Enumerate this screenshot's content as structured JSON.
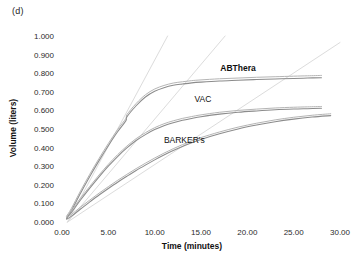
{
  "panel": {
    "label": "(d)"
  },
  "chart_data": {
    "type": "line",
    "title": "",
    "subtitle": "",
    "xlabel": "Time (minutes)",
    "ylabel": "Volume (liters)",
    "xlim": [
      0,
      30
    ],
    "ylim": [
      0,
      1.0
    ],
    "xticks": [
      "0.00",
      "5.00",
      "10.00",
      "15.00",
      "20.00",
      "25.00",
      "30.00"
    ],
    "xtick_values": [
      0,
      5,
      10,
      15,
      20,
      25,
      30
    ],
    "yticks": [
      "0.000",
      "0.100",
      "0.200",
      "0.300",
      "0.400",
      "0.500",
      "0.600",
      "0.700",
      "0.800",
      "0.900",
      "1.000"
    ],
    "ytick_values": [
      0.0,
      0.1,
      0.2,
      0.3,
      0.4,
      0.5,
      0.6,
      0.7,
      0.8,
      0.9,
      1.0
    ],
    "grid": false,
    "legend_position": "inline-annotation",
    "series": [
      {
        "name": "ABThera",
        "label_bold": true,
        "color": "#8c8c8c",
        "x": [
          0.5,
          1.0,
          2.0,
          3.0,
          4.0,
          5.0,
          6.0,
          6.9,
          7.0,
          8.0,
          9.0,
          10.0,
          11.0,
          12.0,
          13.0,
          14.0,
          15.0,
          17.0,
          19.0,
          21.0,
          23.0,
          25.0,
          26.5,
          28.0
        ],
        "y": [
          0.02,
          0.06,
          0.155,
          0.245,
          0.33,
          0.41,
          0.485,
          0.545,
          0.565,
          0.625,
          0.672,
          0.703,
          0.722,
          0.735,
          0.742,
          0.748,
          0.752,
          0.758,
          0.762,
          0.766,
          0.769,
          0.772,
          0.774,
          0.776
        ],
        "band_offset": 0.012
      },
      {
        "name": "VAC",
        "label_bold": false,
        "color": "#9a9a9a",
        "x": [
          0.5,
          1.0,
          2.0,
          3.0,
          4.0,
          5.0,
          6.0,
          7.0,
          8.0,
          9.0,
          10.0,
          11.0,
          12.0,
          13.0,
          14.0,
          15.0,
          17.0,
          19.0,
          21.0,
          23.0,
          25.0,
          26.5,
          28.0
        ],
        "y": [
          0.02,
          0.05,
          0.118,
          0.182,
          0.243,
          0.3,
          0.352,
          0.398,
          0.438,
          0.47,
          0.497,
          0.518,
          0.534,
          0.547,
          0.557,
          0.566,
          0.58,
          0.59,
          0.597,
          0.603,
          0.607,
          0.609,
          0.611
        ],
        "band_offset": 0.01
      },
      {
        "name": "BARKER's",
        "label_bold": false,
        "color": "#9a9a9a",
        "x": [
          0.5,
          1.0,
          2.0,
          3.0,
          4.0,
          5.0,
          6.0,
          7.0,
          8.0,
          9.0,
          10.0,
          11.0,
          12.0,
          13.0,
          14.0,
          15.0,
          17.0,
          19.0,
          21.0,
          23.0,
          25.0,
          27.0,
          29.0
        ],
        "y": [
          0.015,
          0.03,
          0.07,
          0.108,
          0.145,
          0.18,
          0.214,
          0.246,
          0.277,
          0.306,
          0.334,
          0.36,
          0.384,
          0.406,
          0.426,
          0.444,
          0.474,
          0.5,
          0.521,
          0.539,
          0.553,
          0.564,
          0.572
        ],
        "band_offset": 0.01
      }
    ],
    "tangent_lines": [
      {
        "name": "ABThera-initial-slope",
        "x0": 0.6,
        "y0": 0.0,
        "x1": 11.4,
        "y1": 1.0,
        "color": "#dcdcdc"
      },
      {
        "name": "VAC-initial-slope",
        "x0": 0.6,
        "y0": 0.0,
        "x1": 17.6,
        "y1": 1.0,
        "color": "#dcdcdc"
      },
      {
        "name": "BARKERs-initial-slope",
        "x0": 0.6,
        "y0": 0.0,
        "x1": 30.0,
        "y1": 0.965,
        "color": "#dcdcdc"
      }
    ],
    "annotations": [
      {
        "name": "ABThera",
        "text": "ABThera",
        "x": 19.0,
        "y": 0.81,
        "bold": true
      },
      {
        "name": "VAC",
        "text": "VAC",
        "x": 15.2,
        "y": 0.645,
        "bold": false
      },
      {
        "name": "BARKERs",
        "text": "BARKER's",
        "x": 13.2,
        "y": 0.425,
        "bold": false
      }
    ]
  }
}
